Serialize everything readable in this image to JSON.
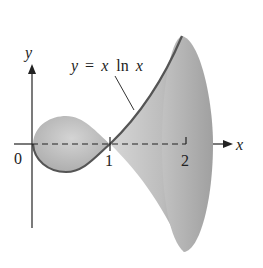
{
  "diagram": {
    "type": "surface-of-revolution",
    "curve_label": {
      "y": "y",
      "eq": "=",
      "x1": "x",
      "ln": "ln",
      "x2": "x"
    },
    "axes": {
      "x_label": "x",
      "y_label": "y"
    },
    "ticks": [
      "0",
      "1",
      "2"
    ],
    "colors": {
      "surface": "#b5b5b5",
      "surface_dark": "#9a9a9a",
      "curve": "#555555",
      "axis": "#222222"
    }
  }
}
